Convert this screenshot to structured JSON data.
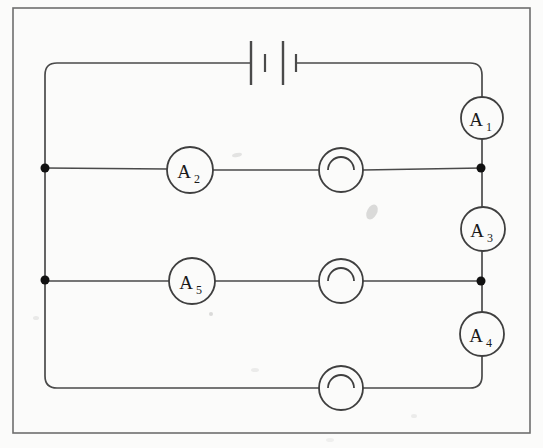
{
  "figure": {
    "kind": "circuit-diagram",
    "title": "",
    "background_color": "#fbfbfa",
    "ink_color": "#4a4a4a",
    "label_color": "#1a1a1a",
    "frame": {
      "x": 13,
      "y": 8,
      "width": 517,
      "height": 425
    }
  },
  "ammeters": [
    {
      "id": "A1",
      "letter": "A",
      "subscript": "1",
      "label": "A₁",
      "cx": 482,
      "cy": 118,
      "r": 21
    },
    {
      "id": "A2",
      "letter": "A",
      "subscript": "2",
      "label": "A₂",
      "cx": 190,
      "cy": 170,
      "r": 23
    },
    {
      "id": "A3",
      "letter": "A",
      "subscript": "3",
      "label": "A₃",
      "cx": 483,
      "cy": 229,
      "r": 22
    },
    {
      "id": "A4",
      "letter": "A",
      "subscript": "4",
      "label": "A₄",
      "cx": 482,
      "cy": 334,
      "r": 22
    },
    {
      "id": "A5",
      "letter": "A",
      "subscript": "5",
      "label": "A₅",
      "cx": 192,
      "cy": 281,
      "r": 23
    }
  ],
  "lamps": [
    {
      "id": "lamp-top",
      "cx": 341,
      "cy": 170,
      "r": 22,
      "filament_r": 13
    },
    {
      "id": "lamp-middle",
      "cx": 341,
      "cy": 281,
      "r": 22,
      "filament_r": 13
    },
    {
      "id": "lamp-bottom",
      "cx": 341,
      "cy": 388,
      "r": 22,
      "filament_r": 13
    }
  ],
  "battery": {
    "id": "battery",
    "cells": 2,
    "center_y": 63,
    "plates": [
      {
        "x": 251,
        "half_height": 22,
        "type": "long"
      },
      {
        "x": 265,
        "half_height": 9,
        "type": "short"
      },
      {
        "x": 283,
        "half_height": 22,
        "type": "long"
      },
      {
        "x": 296,
        "half_height": 9,
        "type": "short"
      }
    ]
  },
  "junction_nodes": [
    {
      "id": "node-left-top",
      "cx": 45,
      "cy": 168,
      "r": 4.5
    },
    {
      "id": "node-left-bottom",
      "cx": 45,
      "cy": 280,
      "r": 4.5
    },
    {
      "id": "node-right-top",
      "cx": 481,
      "cy": 168,
      "r": 4.5
    },
    {
      "id": "node-right-bottom",
      "cx": 481,
      "cy": 281,
      "r": 4.5
    }
  ],
  "wires": {
    "left_rail_x": 45,
    "right_rail_x": 482,
    "top_rail_y": 63,
    "bottom_rail_y": 388,
    "branch_y": [
      168,
      281
    ],
    "corner_radius": 12
  },
  "smudges": [
    {
      "id": "smudge-center",
      "cx": 372,
      "cy": 212,
      "rx": 5,
      "ry": 8,
      "opacity": 0.3
    },
    {
      "id": "smudge-row1",
      "cx": 237,
      "cy": 155,
      "rx": 5,
      "ry": 2,
      "opacity": 0.22
    },
    {
      "id": "smudge-row2",
      "cx": 211,
      "cy": 314,
      "rx": 2,
      "ry": 2,
      "opacity": 0.3
    },
    {
      "id": "smudge-bottom",
      "cx": 255,
      "cy": 370,
      "rx": 4,
      "ry": 2,
      "opacity": 0.14
    },
    {
      "id": "smudge-lowerleft",
      "cx": 36,
      "cy": 318,
      "rx": 3,
      "ry": 2,
      "opacity": 0.16
    }
  ]
}
